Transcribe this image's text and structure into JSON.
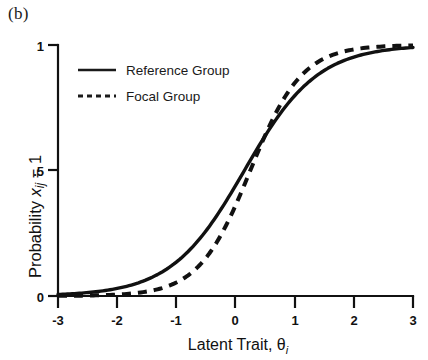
{
  "figure": {
    "panel_label": "(b)",
    "background_color": "#ffffff",
    "ink_color": "#111111"
  },
  "legend": {
    "position": "top-left-inside",
    "entries": [
      {
        "label": "Reference Group",
        "style": "solid",
        "marker": "line-solid-icon"
      },
      {
        "label": "Focal Group",
        "style": "dashed",
        "marker": "line-dashed-icon"
      }
    ]
  },
  "axes": {
    "x": {
      "title_main": "Latent Trait, ",
      "title_symbol": "θ",
      "title_subscript": "i",
      "ticks": [
        "-3",
        "-2",
        "-1",
        "0",
        "1",
        "2",
        "3"
      ],
      "tick_values": [
        -3,
        -2,
        -1,
        0,
        1,
        2,
        3
      ],
      "range": [
        -3,
        3
      ]
    },
    "y": {
      "title_main": "Probability ",
      "title_symbol": "x",
      "title_subscript": "ij",
      "title_suffix": " = 1",
      "ticks": [
        "0",
        ".5",
        "1"
      ],
      "tick_values": [
        0,
        0.5,
        1
      ],
      "range": [
        0,
        1
      ]
    }
  },
  "chart_data": {
    "type": "line",
    "title": "(b)",
    "xlabel": "Latent Trait, θi",
    "ylabel": "Probability xij = 1",
    "xlim": [
      -3,
      3
    ],
    "ylim": [
      0,
      1
    ],
    "grid": false,
    "legend_position": "upper left",
    "x": [
      -3,
      -2.5,
      -2,
      -1.5,
      -1,
      -0.5,
      0,
      0.5,
      1,
      1.5,
      2,
      2.5,
      3
    ],
    "series": [
      {
        "name": "Reference Group",
        "style": "solid",
        "model": "2PL logistic: a=0.95, b=0.15",
        "values": [
          0.06,
          0.09,
          0.13,
          0.19,
          0.26,
          0.35,
          0.46,
          0.57,
          0.67,
          0.76,
          0.83,
          0.88,
          0.92
        ]
      },
      {
        "name": "Focal Group",
        "style": "dashed",
        "model": "2PL logistic: a=1.35, b=0.25",
        "values": [
          0.02,
          0.04,
          0.06,
          0.1,
          0.16,
          0.25,
          0.37,
          0.51,
          0.65,
          0.77,
          0.86,
          0.92,
          0.96
        ]
      }
    ],
    "annotations": [
      {
        "text": "curves cross near θ = 0.2",
        "type": "crossover"
      }
    ]
  }
}
